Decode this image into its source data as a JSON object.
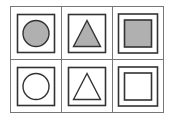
{
  "puzzle": {
    "description": "2x3 grid of framed shapes",
    "colors": {
      "stroke": "#333333",
      "grid_line": "#777777",
      "fill": "#b0b0b0",
      "empty": "#ffffff"
    },
    "rows": [
      {
        "cells": [
          {
            "shape": "circle",
            "frame": "single",
            "filled": true
          },
          {
            "shape": "triangle",
            "frame": "single",
            "filled": true
          },
          {
            "shape": "square",
            "frame": "single",
            "filled": true
          }
        ]
      },
      {
        "cells": [
          {
            "shape": "circle",
            "frame": "single",
            "filled": false
          },
          {
            "shape": "triangle",
            "frame": "single",
            "filled": false
          },
          {
            "shape": "square",
            "frame": "single",
            "filled": false
          }
        ]
      }
    ]
  }
}
